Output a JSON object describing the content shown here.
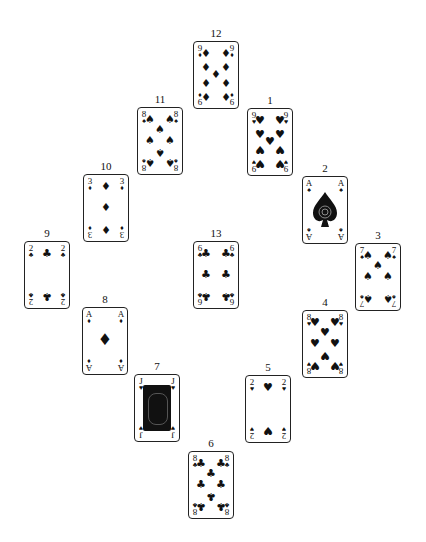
{
  "layout_name": "clock-solitaire-arrangement",
  "cards": [
    {
      "slot": "12",
      "rank": "9",
      "suit": "diamonds",
      "symbol": "♦"
    },
    {
      "slot": "11",
      "rank": "8",
      "suit": "spades",
      "symbol": "♠"
    },
    {
      "slot": "1",
      "rank": "9",
      "suit": "hearts",
      "symbol": "♥"
    },
    {
      "slot": "2",
      "rank": "A",
      "suit": "spades",
      "symbol": "♠"
    },
    {
      "slot": "10",
      "rank": "3",
      "suit": "diamonds",
      "symbol": "♦"
    },
    {
      "slot": "3",
      "rank": "7",
      "suit": "spades",
      "symbol": "♠"
    },
    {
      "slot": "9",
      "rank": "2",
      "suit": "clubs",
      "symbol": "♣"
    },
    {
      "slot": "13",
      "rank": "6",
      "suit": "clubs",
      "symbol": "♣"
    },
    {
      "slot": "4",
      "rank": "8",
      "suit": "hearts",
      "symbol": "♥"
    },
    {
      "slot": "8",
      "rank": "A",
      "suit": "diamonds",
      "symbol": "♦"
    },
    {
      "slot": "5",
      "rank": "2",
      "suit": "hearts",
      "symbol": "♥"
    },
    {
      "slot": "7",
      "rank": "J",
      "suit": "hearts",
      "symbol": "♥"
    },
    {
      "slot": "6",
      "rank": "8",
      "suit": "clubs",
      "symbol": "♣"
    }
  ]
}
